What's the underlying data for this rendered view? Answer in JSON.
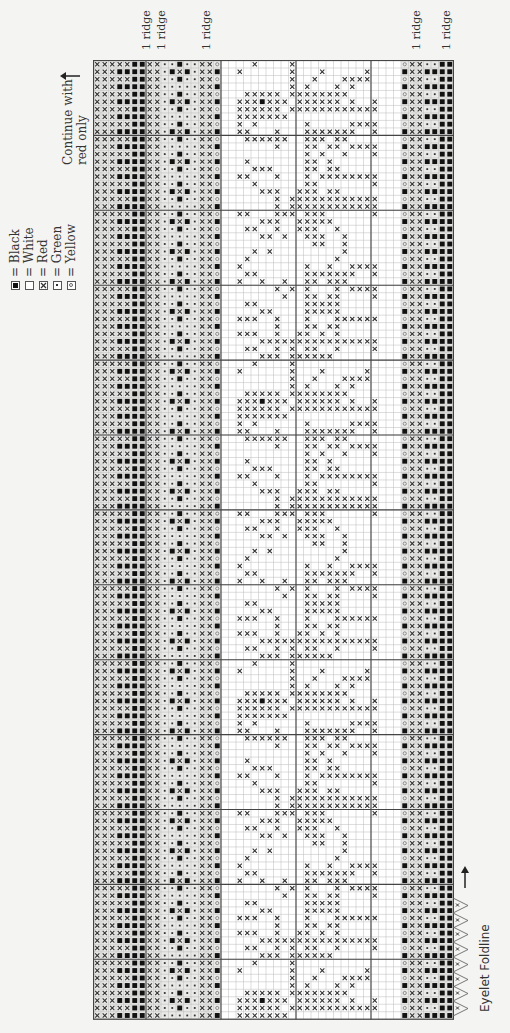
{
  "legend": [
    {
      "symbol": "black",
      "label": "= Black"
    },
    {
      "symbol": "white",
      "label": "= White"
    },
    {
      "symbol": "red",
      "label": "= Red"
    },
    {
      "symbol": "green",
      "label": "= Green"
    },
    {
      "symbol": "yellow",
      "label": "= Yellow"
    }
  ],
  "notes": {
    "continue_line1": "Continue with",
    "continue_line2": "red only",
    "eyelet_label": "Eyelet Foldline",
    "ridge_label": "1 ridge"
  },
  "ridges_after_column": [
    7,
    9,
    15,
    43,
    47
  ],
  "chart": {
    "columns": 48,
    "rows": 128,
    "block_size": 10,
    "symbol_key": {
      "X": "red",
      "B": "black",
      "W": "white",
      "G": "green",
      "Y": "yellow"
    },
    "left_band_rows": [
      "XXXXXBBXXGGBGGXXY",
      "XXXBBBBXXGBXBGXXB",
      "XXXXXBBXXGGBGGXXY",
      "XXXBBBBXXGGGGGXXB"
    ],
    "right_band_rows": [
      "YXXGGBB",
      "BXXBBBB"
    ],
    "motif_width": 24,
    "motif_rows": [
      [
        4,
        9
      ],
      [
        2,
        9,
        13,
        19
      ],
      [
        9,
        12,
        16,
        17,
        18,
        19
      ],
      [
        9,
        11,
        15,
        17
      ],
      [
        3,
        4,
        5,
        6,
        7,
        9,
        10,
        11,
        12,
        13,
        14,
        15,
        16
      ],
      [
        2,
        3,
        4,
        "5B",
        6,
        7,
        8,
        10,
        11,
        12,
        13,
        14,
        15,
        17,
        20
      ],
      [
        2,
        3,
        4,
        5,
        6,
        7,
        9,
        10,
        11,
        12,
        13,
        14,
        15,
        16,
        17,
        18,
        19,
        20
      ],
      [
        2,
        3,
        4,
        5,
        6,
        7,
        8
      ],
      [
        2,
        4,
        11,
        17,
        18,
        19,
        20
      ],
      [
        2,
        3,
        7,
        11,
        12,
        13,
        14,
        15,
        16,
        17,
        20
      ],
      [
        3,
        4,
        5,
        6,
        7,
        8,
        11,
        12,
        13,
        15,
        16
      ],
      [
        7,
        11,
        12,
        14,
        15,
        17,
        18,
        19,
        20
      ],
      [
        11,
        13,
        16,
        20
      ],
      [
        3,
        11,
        12,
        14
      ],
      [
        4,
        5,
        6,
        11,
        12,
        14,
        15
      ],
      [
        2,
        3,
        7,
        11,
        13,
        14,
        15,
        16,
        17,
        18,
        19,
        20
      ],
      [
        4,
        11,
        12,
        20
      ],
      [
        5,
        6,
        7,
        10,
        11,
        12,
        14,
        15
      ],
      [
        7,
        9,
        10,
        11,
        12,
        13,
        14,
        15,
        16,
        17,
        18,
        19,
        20
      ],
      [
        7,
        9,
        10,
        11,
        12,
        13,
        14,
        15,
        16,
        17,
        18,
        19,
        20
      ],
      [
        2,
        3,
        7,
        8,
        9,
        11,
        12,
        13,
        20
      ],
      [
        5,
        6,
        7,
        10,
        11,
        12,
        13,
        14
      ],
      [
        3,
        4,
        7,
        10,
        11,
        12,
        15
      ],
      [
        5,
        6,
        8,
        11,
        12,
        13,
        16
      ],
      [
        12,
        13,
        16
      ],
      [
        4,
        6,
        16
      ],
      [
        3,
        15
      ],
      [
        2,
        11,
        14,
        17,
        18,
        19,
        20
      ],
      [
        3,
        4,
        11,
        12,
        13,
        14,
        15,
        16,
        17,
        20
      ],
      [
        2,
        5,
        8,
        11,
        12,
        14,
        15,
        16
      ],
      [
        7,
        9,
        11,
        15,
        17,
        18,
        19,
        20
      ],
      [
        8,
        11,
        12,
        14,
        15,
        20
      ],
      [
        3,
        4,
        11,
        12,
        13,
        14,
        15
      ],
      [
        5,
        6,
        11,
        12,
        13,
        14,
        15
      ],
      [
        2,
        3,
        4,
        7,
        11,
        15,
        16,
        17,
        18,
        19,
        20
      ],
      [
        7,
        11,
        12,
        14,
        15
      ],
      [
        2,
        3,
        4,
        7,
        10,
        11,
        13,
        15
      ],
      [
        5,
        6,
        7,
        8,
        9,
        10,
        11,
        12,
        13,
        14,
        15,
        16,
        17,
        18,
        19,
        20
      ],
      [
        3,
        4,
        7,
        9,
        11,
        12,
        15,
        20
      ],
      [
        5,
        6,
        7,
        9,
        10,
        11,
        12,
        13,
        14
      ]
    ]
  }
}
